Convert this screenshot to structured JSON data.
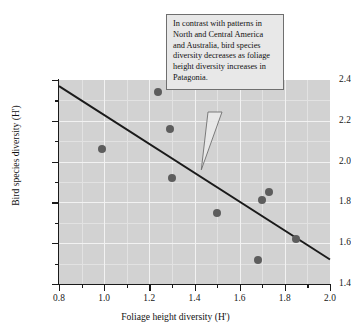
{
  "chart_data": {
    "type": "scatter",
    "title": "",
    "xlabel": "Foliage height diversity (H')",
    "ylabel": "Bird species diversity (H')",
    "xlim": [
      0.8,
      2.0
    ],
    "ylim": [
      1.4,
      2.4
    ],
    "x_ticks": [
      "0.8",
      "1.0",
      "1.2",
      "1.4",
      "1.6",
      "1.8",
      "2.0"
    ],
    "x_tick_values": [
      0.8,
      1.0,
      1.2,
      1.4,
      1.6,
      1.8,
      2.0
    ],
    "x_minor_tick_values": [
      0.9,
      1.1,
      1.3,
      1.5,
      1.7,
      1.9
    ],
    "y_ticks": [
      "1.4",
      "1.6",
      "1.8",
      "2.0",
      "2.2",
      "2.4"
    ],
    "y_tick_values": [
      1.4,
      1.6,
      1.8,
      2.0,
      2.2,
      2.4
    ],
    "y_minor_tick_values": [
      1.5,
      1.7,
      1.9,
      2.1,
      2.3
    ],
    "grid": true,
    "legend": "none",
    "marker_color": "#5d5d5d",
    "plot_background": "#d2d2d2",
    "gridline_color": "#f2f2f2",
    "line_color": "#1a1a1a",
    "points": [
      {
        "x": 0.99,
        "y": 2.06
      },
      {
        "x": 1.24,
        "y": 2.34
      },
      {
        "x": 1.29,
        "y": 2.16
      },
      {
        "x": 1.3,
        "y": 1.92
      },
      {
        "x": 1.5,
        "y": 1.75
      },
      {
        "x": 1.68,
        "y": 1.52
      },
      {
        "x": 1.7,
        "y": 1.81
      },
      {
        "x": 1.73,
        "y": 1.85
      },
      {
        "x": 1.85,
        "y": 1.62
      }
    ],
    "trendline": {
      "x0": 0.8,
      "y0": 2.37,
      "x1": 2.0,
      "y1": 1.52
    },
    "annotations": [
      {
        "text": "In contrast with patterns in North and Central America and Australia, bird species diversity decreases as foliage height diversity increases in Patagonia.",
        "points_to": {
          "x": 1.43,
          "y": 1.96
        }
      }
    ]
  }
}
